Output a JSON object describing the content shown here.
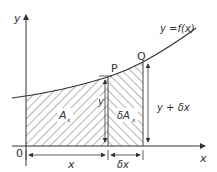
{
  "diagram": {
    "curve_label": "y =f(x)",
    "axes": {
      "x_label": "x",
      "y_label": "y",
      "origin_label": "0"
    },
    "points": {
      "p_label": "P",
      "q_label": "Q"
    },
    "regions": {
      "area_label_main": "A",
      "area_label_sub": "x",
      "strip_label_main": "δA",
      "strip_label_sub": "x"
    },
    "heights": {
      "left_height_label": "y",
      "right_height_label": "y + δx"
    },
    "dimensions": {
      "x_span_label": "x",
      "dx_span_label": "δx"
    },
    "colors": {
      "line": "#333333",
      "hatch": "#555555",
      "background": "#ffffff"
    }
  }
}
